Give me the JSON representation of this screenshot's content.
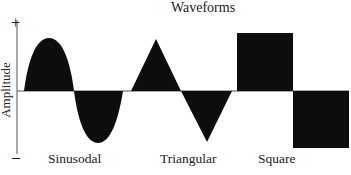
{
  "diagram": {
    "title": "Waveforms",
    "y_axis_label": "Amplitude",
    "y_axis_positive": "+",
    "y_axis_negative": "–",
    "waveforms": [
      {
        "name": "Sinusodal",
        "shape": "sine"
      },
      {
        "name": "Triangular",
        "shape": "triangle"
      },
      {
        "name": "Square",
        "shape": "square"
      }
    ],
    "fill_color": "#0d0d0d",
    "axis_color": "#555555"
  }
}
